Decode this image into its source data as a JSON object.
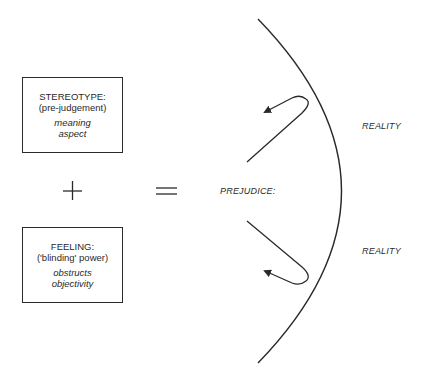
{
  "diagram": {
    "boxes": [
      {
        "title": "STEREOTYPE:",
        "subtitle": "(pre-judgement)",
        "italic_lines": [
          "meaning",
          "aspect"
        ]
      },
      {
        "title": "FEELING:",
        "subtitle": "('blinding' power)",
        "italic_lines": [
          "obstructs",
          "objectivity"
        ]
      }
    ],
    "operators": {
      "plus": "+",
      "equals": "="
    },
    "result_label": "PREJUDICE:",
    "reality_labels": [
      "REALITY",
      "REALITY"
    ],
    "colors": {
      "ink": "#2a2a2a",
      "background": "#ffffff"
    },
    "icons": {
      "boundary": "curved-boundary-arc",
      "top_arrow": "hook-arrow-deflected-icon",
      "bottom_arrow": "hook-arrow-deflected-icon"
    }
  }
}
